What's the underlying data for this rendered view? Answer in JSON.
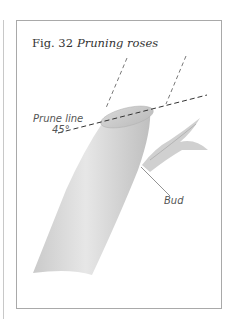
{
  "figure": {
    "number": "Fig. 32",
    "title": "Pruning roses"
  },
  "labels": {
    "prune_line": "Prune line",
    "angle": "45°",
    "bud": "Bud"
  },
  "colors": {
    "frame": "#a9a9a9",
    "stem_fill": "#d8d8d8",
    "dashed_line": "#333333",
    "text": "#555555"
  }
}
